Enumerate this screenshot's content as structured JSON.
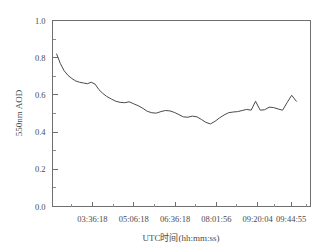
{
  "chart_data": {
    "type": "line",
    "title": "",
    "subtitle": "",
    "xlabel": "UTC时间(hh:mm:ss)",
    "ylabel": "550nm AOD",
    "grid": false,
    "legend": null,
    "legend_position": "none",
    "ylim": [
      0.0,
      1.0
    ],
    "y_ticks": [
      "0.0",
      "0.2",
      "0.4",
      "0.6",
      "0.8",
      "1.0"
    ],
    "y_tick_values": [
      0.0,
      0.2,
      0.4,
      0.6,
      0.8,
      1.0
    ],
    "y_minor_tick_values": [
      0.1,
      0.3,
      0.5,
      0.7,
      0.9
    ],
    "x_ticks": [
      "03:36:18",
      "05:06:18",
      "06:36:18",
      "08:01:56",
      "09:20:04",
      "09:44:55"
    ],
    "x_tick_positions": [
      0.155,
      0.315,
      0.475,
      0.635,
      0.795,
      0.925
    ],
    "x_minor_tick_positions": [
      0.075,
      0.235,
      0.395,
      0.555,
      0.715,
      0.86,
      0.985
    ],
    "series": [
      {
        "name": "550nm AOD",
        "color": "#4a4a4a",
        "x": [
          0.016,
          0.03,
          0.045,
          0.06,
          0.075,
          0.09,
          0.105,
          0.12,
          0.135,
          0.15,
          0.165,
          0.18,
          0.195,
          0.21,
          0.228,
          0.245,
          0.262,
          0.28,
          0.297,
          0.315,
          0.332,
          0.35,
          0.367,
          0.385,
          0.402,
          0.42,
          0.437,
          0.455,
          0.472,
          0.49,
          0.507,
          0.525,
          0.542,
          0.56,
          0.577,
          0.595,
          0.612,
          0.63,
          0.647,
          0.665,
          0.682,
          0.7,
          0.717,
          0.735,
          0.752,
          0.77,
          0.787,
          0.805,
          0.822,
          0.84,
          0.857,
          0.875,
          0.892,
          0.91,
          0.927,
          0.945
        ],
        "values": [
          0.82,
          0.77,
          0.73,
          0.705,
          0.688,
          0.675,
          0.668,
          0.664,
          0.66,
          0.668,
          0.658,
          0.628,
          0.608,
          0.592,
          0.578,
          0.566,
          0.56,
          0.558,
          0.563,
          0.552,
          0.542,
          0.528,
          0.512,
          0.504,
          0.502,
          0.51,
          0.516,
          0.514,
          0.506,
          0.494,
          0.482,
          0.48,
          0.486,
          0.482,
          0.468,
          0.452,
          0.444,
          0.458,
          0.476,
          0.492,
          0.504,
          0.508,
          0.51,
          0.516,
          0.522,
          0.518,
          0.566,
          0.518,
          0.52,
          0.534,
          0.532,
          0.524,
          0.518,
          0.56,
          0.598,
          0.566
        ]
      }
    ]
  },
  "axes": {
    "y_axis_label": "550nm AOD",
    "x_axis_label": "UTC时间(hh:mm:ss)"
  }
}
